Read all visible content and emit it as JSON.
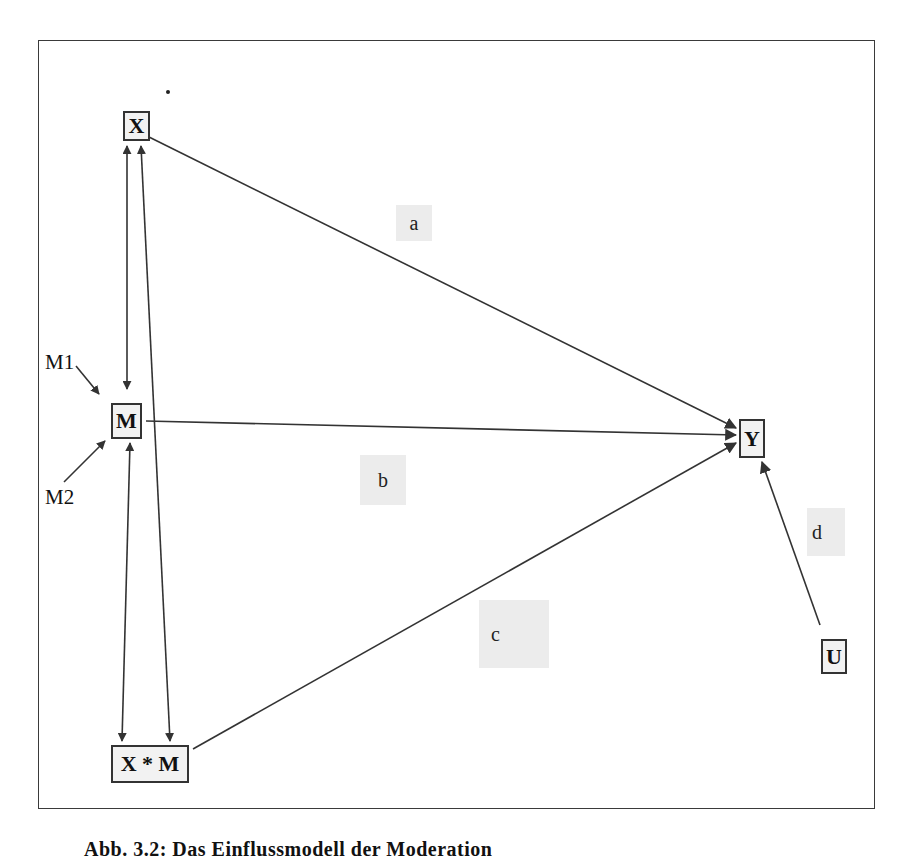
{
  "diagram": {
    "type": "moderation-path-model",
    "nodes": {
      "x": {
        "label": "X"
      },
      "m": {
        "label": "M"
      },
      "xm": {
        "label": "X * M"
      },
      "y": {
        "label": "Y"
      },
      "u": {
        "label": "U"
      }
    },
    "path_labels": {
      "a": "a",
      "b": "b",
      "c": "c",
      "d": "d"
    },
    "external_inputs": {
      "m1": "M1",
      "m2": "M2"
    },
    "edges": [
      {
        "from": "X",
        "to": "Y",
        "label": "a",
        "directed": true
      },
      {
        "from": "M",
        "to": "Y",
        "label": "b",
        "directed": true
      },
      {
        "from": "X * M",
        "to": "Y",
        "label": "c",
        "directed": true
      },
      {
        "from": "U",
        "to": "Y",
        "label": "d",
        "directed": true
      },
      {
        "from": "X",
        "to": "M",
        "bidirectional": true
      },
      {
        "from": "X",
        "to": "X * M",
        "bidirectional": true
      },
      {
        "from": "M",
        "to": "X * M",
        "bidirectional": true
      },
      {
        "from": "M1",
        "to": "M",
        "directed": true
      },
      {
        "from": "M2",
        "to": "M",
        "directed": true
      }
    ],
    "colors": {
      "line": "#333333",
      "node_fill": "#f2f2f2",
      "label_shade": "#ececec"
    }
  },
  "caption": "Abb. 3.2: Das Einflussmodell der Moderation"
}
